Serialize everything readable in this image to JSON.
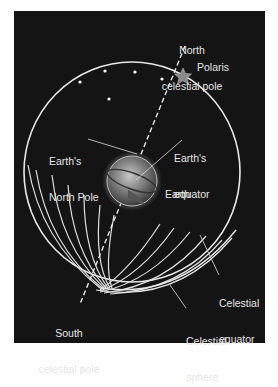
{
  "diagram": {
    "title": "Celestial sphere",
    "colors": {
      "background": "#141414",
      "lines": "#e8e8e8",
      "text": "#e6e6e6",
      "page": "#ffffff"
    },
    "labels": {
      "north_celestial_pole": [
        "North",
        "celestial pole"
      ],
      "polaris": "Polaris",
      "earths_north_pole": [
        "Earth's",
        "North Pole"
      ],
      "earths_equator": [
        "Earth's",
        "equator"
      ],
      "earth": "Earth",
      "celestial_equator": [
        "Celestial",
        "equator"
      ],
      "south_celestial_pole": [
        "South",
        "celestial pole"
      ],
      "celestial_sphere": [
        "Celestial",
        "sphere"
      ]
    },
    "icons": [
      "star-icon",
      "earth-globe-icon"
    ]
  }
}
